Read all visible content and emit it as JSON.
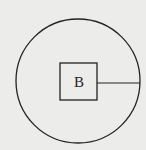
{
  "diagram": {
    "background": "#ececeb",
    "stroke": "#222222",
    "circle": {
      "cx": 78,
      "cy": 81,
      "r": 62
    },
    "square": {
      "x": 60,
      "y": 63,
      "width": 37,
      "height": 37,
      "label": "B"
    },
    "radius_line": {
      "x1": 97,
      "y1": 83,
      "x2": 140,
      "y2": 83
    }
  }
}
